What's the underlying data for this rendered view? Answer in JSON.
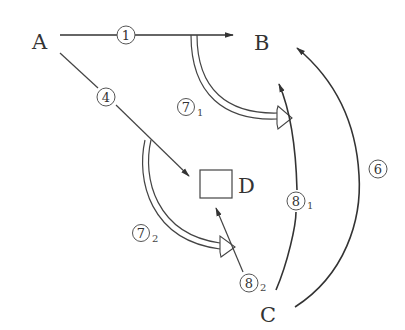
{
  "diagram": {
    "title": "",
    "colors": {
      "stroke": "#333333",
      "background": "#ffffff"
    },
    "nodes": [
      {
        "id": "A",
        "label": "A",
        "x": 40,
        "y": 48
      },
      {
        "id": "B",
        "label": "B",
        "x": 262,
        "y": 50
      },
      {
        "id": "C",
        "label": "C",
        "x": 268,
        "y": 320
      },
      {
        "id": "D",
        "label": "D",
        "x": 246,
        "y": 193,
        "shape": "square"
      }
    ],
    "edges": [
      {
        "id": "e1",
        "label": "1",
        "subscript": "",
        "from": "A",
        "to": "B",
        "style": "solid-arrow"
      },
      {
        "id": "e4",
        "label": "4",
        "subscript": "",
        "from": "A",
        "to": "D",
        "style": "thin-arrow"
      },
      {
        "id": "e6",
        "label": "6",
        "subscript": "",
        "from": "C",
        "to": "B",
        "style": "curved-arrow"
      },
      {
        "id": "e7_1",
        "label": "7",
        "subscript": "1",
        "from": "edge-1",
        "to": "edge-8_1",
        "style": "hollow-double-arrow"
      },
      {
        "id": "e7_2",
        "label": "7",
        "subscript": "2",
        "from": "edge-4",
        "to": "edge-8_2",
        "style": "hollow-double-arrow"
      },
      {
        "id": "e8_1",
        "label": "8",
        "subscript": "1",
        "from": "C",
        "to": "B",
        "style": "curved-arrow"
      },
      {
        "id": "e8_2",
        "label": "8",
        "subscript": "2",
        "from": "C",
        "to": "D",
        "style": "thin-arrow"
      }
    ],
    "labels": {
      "A": "A",
      "B": "B",
      "C": "C",
      "D": "D",
      "e1": "1",
      "e4": "4",
      "e6": "6",
      "e7_1": "7",
      "e7_1_sub": "1",
      "e7_2": "7",
      "e7_2_sub": "2",
      "e8_1": "8",
      "e8_1_sub": "1",
      "e8_2": "8",
      "e8_2_sub": "2"
    }
  }
}
